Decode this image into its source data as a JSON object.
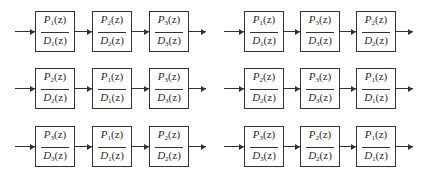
{
  "diagram": {
    "title": "",
    "chains": [
      {
        "id": "row1-left",
        "blocks": [
          {
            "num": "P",
            "num_sub": "1",
            "den": "D",
            "den_sub": "1",
            "arg": "(z)"
          },
          {
            "num": "P",
            "num_sub": "2",
            "den": "D",
            "den_sub": "2",
            "arg": "(z)"
          },
          {
            "num": "P",
            "num_sub": "3",
            "den": "D",
            "den_sub": "3",
            "arg": "(z)"
          }
        ]
      },
      {
        "id": "row1-right",
        "blocks": [
          {
            "num": "P",
            "num_sub": "1",
            "den": "D",
            "den_sub": "1",
            "arg": "(z)"
          },
          {
            "num": "P",
            "num_sub": "3",
            "den": "D",
            "den_sub": "3",
            "arg": "(z)"
          },
          {
            "num": "P",
            "num_sub": "2",
            "den": "D",
            "den_sub": "2",
            "arg": "(z)"
          }
        ]
      },
      {
        "id": "row2-left",
        "blocks": [
          {
            "num": "P",
            "num_sub": "2",
            "den": "D",
            "den_sub": "2",
            "arg": "(z)"
          },
          {
            "num": "P",
            "num_sub": "1",
            "den": "D",
            "den_sub": "1",
            "arg": "(z)"
          },
          {
            "num": "P",
            "num_sub": "3",
            "den": "D",
            "den_sub": "3",
            "arg": "(z)"
          }
        ]
      },
      {
        "id": "row2-right",
        "blocks": [
          {
            "num": "P",
            "num_sub": "2",
            "den": "D",
            "den_sub": "2",
            "arg": "(z)"
          },
          {
            "num": "P",
            "num_sub": "3",
            "den": "D",
            "den_sub": "3",
            "arg": "(z)"
          },
          {
            "num": "P",
            "num_sub": "1",
            "den": "D",
            "den_sub": "1",
            "arg": "(z)"
          }
        ]
      },
      {
        "id": "row3-left",
        "blocks": [
          {
            "num": "P",
            "num_sub": "3",
            "den": "D",
            "den_sub": "3",
            "arg": "(z)"
          },
          {
            "num": "P",
            "num_sub": "1",
            "den": "D",
            "den_sub": "1",
            "arg": "(z)"
          },
          {
            "num": "P",
            "num_sub": "2",
            "den": "D",
            "den_sub": "2",
            "arg": "(z)"
          }
        ]
      },
      {
        "id": "row3-right",
        "blocks": [
          {
            "num": "P",
            "num_sub": "3",
            "den": "D",
            "den_sub": "3",
            "arg": "(z)"
          },
          {
            "num": "P",
            "num_sub": "2",
            "den": "D",
            "den_sub": "2",
            "arg": "(z)"
          },
          {
            "num": "P",
            "num_sub": "1",
            "den": "D",
            "den_sub": "1",
            "arg": "(z)"
          }
        ]
      }
    ],
    "colors": {
      "stroke": "#333333",
      "background": "#ffffff",
      "text": "#2a2a2a"
    }
  }
}
